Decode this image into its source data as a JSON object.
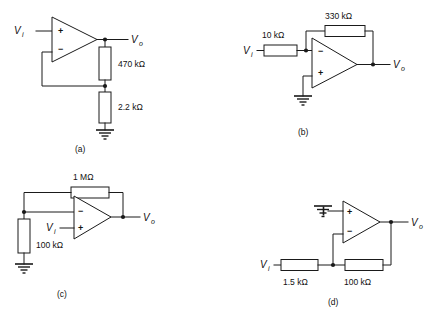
{
  "figure": {
    "type": "op-amp circuit schematics",
    "panel_count": 4
  },
  "panels": [
    {
      "id": "a",
      "caption": "(a)",
      "topology": "non-inverting amplifier",
      "opamp": {
        "plus_pin": "+",
        "minus_pin": "−",
        "plus_position": "top",
        "minus_position": "bottom"
      },
      "input_label": "V",
      "input_sub": "i",
      "output_label": "V",
      "output_sub": "o",
      "components": [
        {
          "name": "feedback-resistor",
          "label": "470 kΩ",
          "orientation": "vertical"
        },
        {
          "name": "ground-resistor",
          "label": "2.2 kΩ",
          "orientation": "vertical"
        }
      ],
      "has_ground": true
    },
    {
      "id": "b",
      "caption": "(b)",
      "topology": "inverting amplifier",
      "opamp": {
        "plus_pin": "+",
        "minus_pin": "−",
        "plus_position": "bottom",
        "minus_position": "top"
      },
      "input_label": "V",
      "input_sub": "i",
      "output_label": "V",
      "output_sub": "o",
      "components": [
        {
          "name": "feedback-resistor",
          "label": "330 kΩ",
          "orientation": "horizontal"
        },
        {
          "name": "input-resistor",
          "label": "10  kΩ",
          "orientation": "horizontal"
        }
      ],
      "has_ground": true
    },
    {
      "id": "c",
      "caption": "(c)",
      "topology": "non-inverting amplifier",
      "opamp": {
        "plus_pin": "+",
        "minus_pin": "−",
        "plus_position": "bottom",
        "minus_position": "top"
      },
      "input_label": "V",
      "input_sub": "i",
      "output_label": "V",
      "output_sub": "o",
      "components": [
        {
          "name": "feedback-resistor",
          "label": "1 MΩ",
          "orientation": "horizontal"
        },
        {
          "name": "ground-resistor",
          "label": "100 kΩ",
          "orientation": "vertical"
        }
      ],
      "has_ground": true
    },
    {
      "id": "d",
      "caption": "(d)",
      "topology": "inverting amplifier",
      "opamp": {
        "plus_pin": "+",
        "minus_pin": "−",
        "plus_position": "top",
        "minus_position": "bottom"
      },
      "input_label": "V",
      "input_sub": "i",
      "output_label": "V",
      "output_sub": "o",
      "components": [
        {
          "name": "input-resistor",
          "label": "1.5 kΩ",
          "orientation": "horizontal"
        },
        {
          "name": "feedback-resistor",
          "label": "100 kΩ",
          "orientation": "horizontal"
        }
      ],
      "has_ground": true
    }
  ],
  "colors": {
    "ink": "#1a1a1a",
    "background": "#ffffff"
  }
}
